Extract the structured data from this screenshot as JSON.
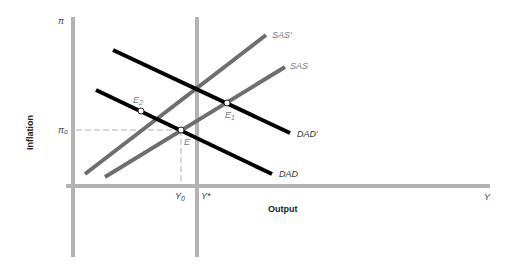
{
  "diagram": {
    "y_axis_symbol": "π",
    "y_axis_title": "Inflation",
    "x_axis_title": "Output",
    "x_axis_symbol": "Y",
    "pi0_label": "π₀",
    "y0_label": "Y",
    "y0_sub": "0",
    "ystar_label": "Y*",
    "curves": {
      "sas_prime": "SAS′",
      "sas": "SAS",
      "dad_prime": "DAD′",
      "dad": "DAD"
    },
    "points": {
      "e": "E",
      "e1": "E",
      "e1_sub": "1",
      "e2": "E",
      "e2_sub": "2"
    },
    "colors": {
      "axis": "#b3b3b3",
      "sas": "#6e6e6e",
      "dad": "#000000",
      "dashed": "#b0b0b0"
    }
  }
}
